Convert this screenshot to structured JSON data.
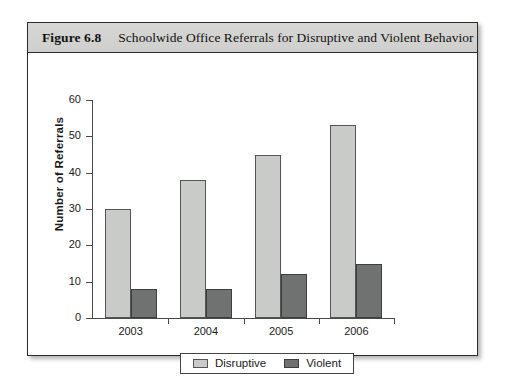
{
  "figure": {
    "number": "Figure 6.8",
    "title": "Schoolwide Office Referrals for Disruptive and Violent Behavior"
  },
  "legend": {
    "items": [
      {
        "label": "Disruptive",
        "swatch": "light-gray-swatch-icon",
        "color": "#c9cbc9"
      },
      {
        "label": "Violent",
        "swatch": "dark-gray-swatch-icon",
        "color": "#6f7271"
      }
    ]
  },
  "chart_data": {
    "type": "bar",
    "title": "Schoolwide Office Referrals for Disruptive and Violent Behavior",
    "xlabel": "",
    "ylabel": "Number of Referrals",
    "categories": [
      "2003",
      "2004",
      "2005",
      "2006"
    ],
    "series": [
      {
        "name": "Disruptive",
        "color": "#c9cbc9",
        "values": [
          30,
          38,
          45,
          53
        ]
      },
      {
        "name": "Violent",
        "color": "#6f7271",
        "values": [
          8,
          8,
          12,
          15
        ]
      }
    ],
    "ylim": [
      0,
      60
    ],
    "yticks": [
      0,
      10,
      20,
      30,
      40,
      50,
      60
    ],
    "ytick_labels": [
      "0",
      "10",
      "20",
      "30",
      "40",
      "50",
      "60"
    ],
    "grid": false,
    "legend_position": "bottom-center"
  }
}
